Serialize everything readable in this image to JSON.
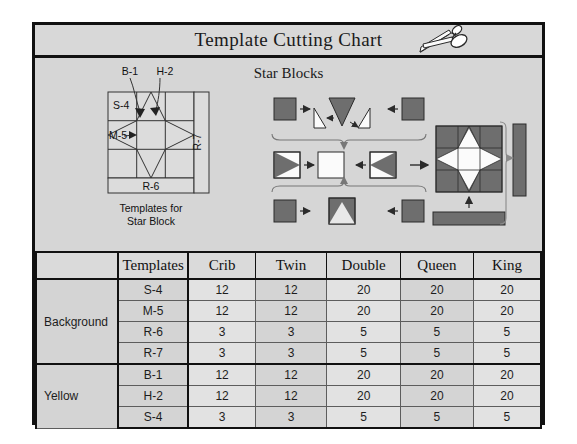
{
  "header": {
    "title": "Template Cutting Chart",
    "scissors_icon": "scissors-icon"
  },
  "diagram": {
    "heading": "Star Blocks",
    "templates_caption_line1": "Templates for",
    "templates_caption_line2": "Star Block",
    "template_labels": {
      "b1": "B-1",
      "h2": "H-2",
      "s4": "S-4",
      "m5": "M-5",
      "r7": "R-7",
      "r6": "R-6"
    }
  },
  "table": {
    "columns": [
      "",
      "Templates",
      "Crib",
      "Twin",
      "Double",
      "Queen",
      "King"
    ],
    "groups": [
      {
        "name": "Background",
        "rows": [
          {
            "template": "S-4",
            "crib": "12",
            "twin": "12",
            "double": "20",
            "queen": "20",
            "king": "20"
          },
          {
            "template": "M-5",
            "crib": "12",
            "twin": "12",
            "double": "20",
            "queen": "20",
            "king": "20"
          },
          {
            "template": "R-6",
            "crib": "3",
            "twin": "3",
            "double": "5",
            "queen": "5",
            "king": "5"
          },
          {
            "template": "R-7",
            "crib": "3",
            "twin": "3",
            "double": "5",
            "queen": "5",
            "king": "5"
          }
        ]
      },
      {
        "name": "Yellow",
        "rows": [
          {
            "template": "B-1",
            "crib": "12",
            "twin": "12",
            "double": "20",
            "queen": "20",
            "king": "20"
          },
          {
            "template": "H-2",
            "crib": "12",
            "twin": "12",
            "double": "20",
            "queen": "20",
            "king": "20"
          },
          {
            "template": "S-4",
            "crib": "3",
            "twin": "3",
            "double": "5",
            "queen": "5",
            "king": "5"
          }
        ]
      }
    ]
  },
  "colors": {
    "page_background": "#ffffff",
    "panel_background": "#d6d6d6",
    "frame_border": "#111111",
    "fabric_gray": "#6e6e6e",
    "fabric_white": "#fbfbfb",
    "row_light": "#e2e2e2",
    "row_dark": "#d4d4d4"
  }
}
